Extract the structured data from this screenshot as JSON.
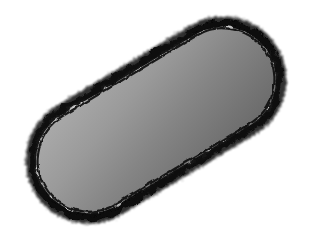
{
  "image": {
    "kind": "transmission-electron-micrograph",
    "subject": "rod-shaped bacterial cell",
    "width": 312,
    "height": 243,
    "background_color": "#ffffff",
    "alt_text": "Transmission electron micrograph of a rod-shaped bacterium tilted diagonally, showing a dark granular cell envelope, finely granular cytoplasm, a dark nucleoid band, and a pale ovoid storage inclusion."
  },
  "cell": {
    "label": "bacterial-cell",
    "center_x": 156,
    "center_y": 120,
    "length": 268,
    "width": 112,
    "rotation_deg": -31,
    "cytoplasm_color": "#8c8c8c",
    "cytoplasm_dark": "#4a4a4a",
    "cytoplasm_light": "#b9b9b9"
  },
  "envelope": {
    "label": "cell-envelope",
    "outer_color": "#121212",
    "inner_line_color": "#0a0a0a",
    "outer_thickness": 7,
    "inner_thickness": 2,
    "roughness": "fuzzy-granular"
  },
  "features": [
    {
      "name": "storage-granule-pale",
      "type": "inclusion-body",
      "cx": 136,
      "cy": 154,
      "rx": 29,
      "ry": 21,
      "rotation_deg": -22,
      "fill": "#c4c4c4",
      "rim": "#5a5a5a",
      "tone": "light"
    },
    {
      "name": "granule-upper-round",
      "type": "inclusion-body",
      "cx": 79,
      "cy": 59,
      "rx": 18,
      "ry": 15,
      "rotation_deg": -18,
      "fill": "#6e6e6e",
      "rim": "#4e4e4e",
      "tone": "dark"
    },
    {
      "name": "granule-small-round",
      "type": "inclusion-body",
      "cx": 97,
      "cy": 77,
      "rx": 8,
      "ry": 7,
      "rotation_deg": 0,
      "fill": "#757575",
      "rim": "#4a4a4a",
      "tone": "mid"
    },
    {
      "name": "nucleoid-band",
      "type": "nucleoid",
      "cx": 112,
      "cy": 104,
      "rx": 48,
      "ry": 16,
      "rotation_deg": -14,
      "fill": "#3b3b3b",
      "rim": "#2e2e2e",
      "tone": "very-dark"
    },
    {
      "name": "dark-spot-left",
      "type": "electron-dense-spot",
      "cx": 76,
      "cy": 95,
      "rx": 7,
      "ry": 6,
      "rotation_deg": 0,
      "fill": "#2a2a2a",
      "rim": "#1f1f1f",
      "tone": "very-dark"
    },
    {
      "name": "dark-spot-center",
      "type": "electron-dense-spot",
      "cx": 95,
      "cy": 107,
      "rx": 6,
      "ry": 9,
      "rotation_deg": 10,
      "fill": "#262626",
      "rim": "#1c1c1c",
      "tone": "very-dark"
    },
    {
      "name": "cytoplasm-patch-right",
      "type": "density-patch",
      "cx": 210,
      "cy": 148,
      "rx": 42,
      "ry": 28,
      "rotation_deg": -30,
      "fill": "#6a6a6a",
      "rim": "#5c5c5c",
      "tone": "mid-dark"
    },
    {
      "name": "cytoplasm-patch-upper",
      "type": "density-patch",
      "cx": 150,
      "cy": 85,
      "rx": 34,
      "ry": 20,
      "rotation_deg": -30,
      "fill": "#7f7f7f",
      "rim": "#737373",
      "tone": "mid"
    }
  ],
  "scalebar": {
    "present": false,
    "label": ""
  },
  "annotations": {
    "present": false,
    "items": []
  }
}
